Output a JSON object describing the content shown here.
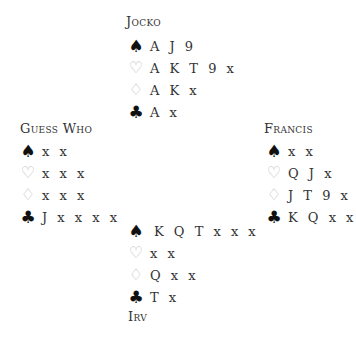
{
  "hands": {
    "north": {
      "name": "Jocko",
      "spades": "A J 9",
      "hearts": "A K T 9 x",
      "diamonds": "A K x",
      "clubs": "A x"
    },
    "west": {
      "name": "Guess Who",
      "spades": "x x",
      "hearts": "x x x",
      "diamonds": "x x x",
      "clubs": "J x x x x"
    },
    "east": {
      "name": "Francis",
      "spades": "x x",
      "hearts": "Q J x",
      "diamonds": "J T 9 x",
      "clubs": "K Q x x"
    },
    "south": {
      "name": "Irv",
      "spades": "K Q T x x x",
      "hearts": "x x",
      "diamonds": "Q x x",
      "clubs": "T x"
    }
  },
  "suits": {
    "spade": "♠",
    "heart": "♡",
    "diamond": "♢",
    "club": "♣"
  }
}
